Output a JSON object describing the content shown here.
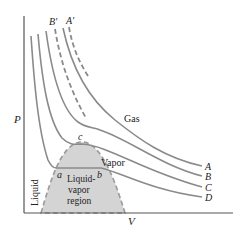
{
  "diagram": {
    "axes": {
      "y_label": "P",
      "x_label": "V"
    },
    "curve_labels": {
      "A": "A",
      "B": "B",
      "C": "C",
      "D": "D",
      "A_prime": "A′",
      "B_prime": "B′"
    },
    "region_labels": {
      "gas": "Gas",
      "vapor": "Vapor",
      "liquid": "Liquid",
      "liquid_vapor_line1": "Liquid-",
      "liquid_vapor_line2": "vapor",
      "liquid_vapor_line3": "region"
    },
    "point_labels": {
      "a": "a",
      "b": "b",
      "c": "c"
    },
    "colors": {
      "curve": "#8a8a8a",
      "dome_fill": "#d4d4d4",
      "axis": "#555555",
      "text": "#222222"
    }
  }
}
